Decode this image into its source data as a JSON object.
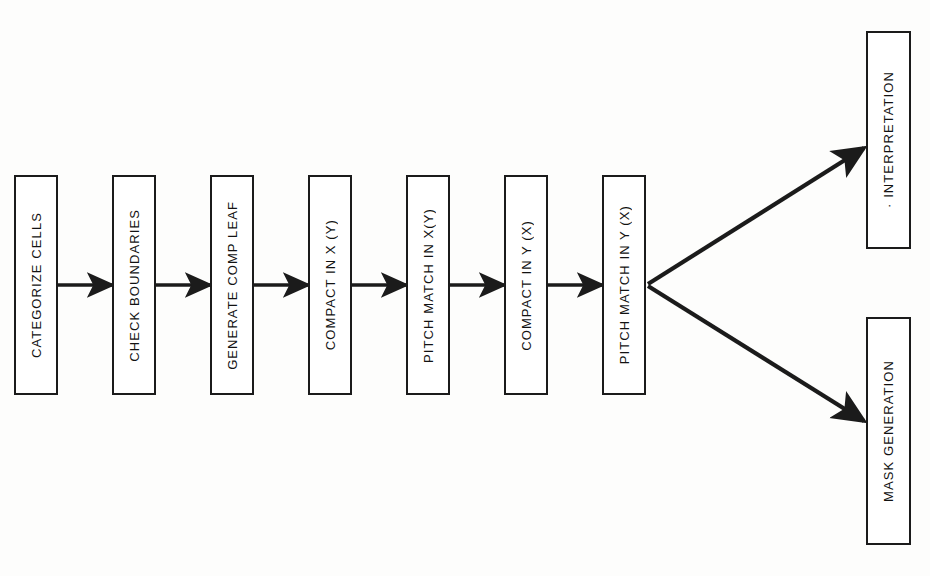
{
  "diagram": {
    "background_color": "#fdfdfc",
    "stroke_color": "#1b1b1b",
    "box_fill": "#ffffff",
    "orientation": "left-to-right with terminal fan-out",
    "pipeline": [
      {
        "id": "categorize-cells",
        "label": "CATEGORIZE CELLS",
        "x": 14,
        "y": 175,
        "w": 44,
        "h": 220
      },
      {
        "id": "check-boundaries",
        "label": "CHECK BOUNDARIES",
        "x": 112,
        "y": 175,
        "w": 44,
        "h": 220
      },
      {
        "id": "generate-comp-leaf",
        "label": "GENERATE COMP LEAF",
        "x": 210,
        "y": 175,
        "w": 44,
        "h": 220
      },
      {
        "id": "compact-in-x-y",
        "label": "COMPACT IN X (Y)",
        "x": 308,
        "y": 175,
        "w": 44,
        "h": 220
      },
      {
        "id": "pitch-match-in-x-y",
        "label": "PITCH MATCH IN X(Y)",
        "x": 406,
        "y": 175,
        "w": 44,
        "h": 220
      },
      {
        "id": "compact-in-y-x",
        "label": "COMPACT IN Y (X)",
        "x": 504,
        "y": 175,
        "w": 44,
        "h": 220
      },
      {
        "id": "pitch-match-in-y-x",
        "label": "PITCH MATCH IN Y (X)",
        "x": 602,
        "y": 175,
        "w": 44,
        "h": 220
      }
    ],
    "outputs": [
      {
        "id": "interpretation",
        "label": "· INTERPRETATION",
        "x": 866,
        "y": 31,
        "w": 45,
        "h": 218
      },
      {
        "id": "mask-generation",
        "label": "MASK GENERATION",
        "x": 866,
        "y": 317,
        "w": 45,
        "h": 228
      }
    ],
    "connectors": [
      {
        "id": "arrow-1-2",
        "from": "categorize-cells",
        "to": "check-boundaries",
        "x1": 58,
        "y1": 285,
        "x2": 112,
        "y2": 285,
        "kind": "straight"
      },
      {
        "id": "arrow-2-3",
        "from": "check-boundaries",
        "to": "generate-comp-leaf",
        "x1": 156,
        "y1": 285,
        "x2": 210,
        "y2": 285,
        "kind": "straight"
      },
      {
        "id": "arrow-3-4",
        "from": "generate-comp-leaf",
        "to": "compact-in-x-y",
        "x1": 254,
        "y1": 285,
        "x2": 308,
        "y2": 285,
        "kind": "straight"
      },
      {
        "id": "arrow-4-5",
        "from": "compact-in-x-y",
        "to": "pitch-match-in-x-y",
        "x1": 352,
        "y1": 285,
        "x2": 406,
        "y2": 285,
        "kind": "straight"
      },
      {
        "id": "arrow-5-6",
        "from": "pitch-match-in-x-y",
        "to": "compact-in-y-x",
        "x1": 450,
        "y1": 285,
        "x2": 504,
        "y2": 285,
        "kind": "straight"
      },
      {
        "id": "arrow-6-7",
        "from": "compact-in-y-x",
        "to": "pitch-match-in-y-x",
        "x1": 548,
        "y1": 285,
        "x2": 602,
        "y2": 285,
        "kind": "straight"
      },
      {
        "id": "arrow-7-interpretation",
        "from": "pitch-match-in-y-x",
        "to": "interpretation",
        "x1": 648,
        "y1": 284,
        "x2": 864,
        "y2": 148,
        "kind": "diagonal-up"
      },
      {
        "id": "arrow-7-mask-generation",
        "from": "pitch-match-in-y-x",
        "to": "mask-generation",
        "x1": 648,
        "y1": 286,
        "x2": 864,
        "y2": 421,
        "kind": "diagonal-down"
      }
    ]
  }
}
